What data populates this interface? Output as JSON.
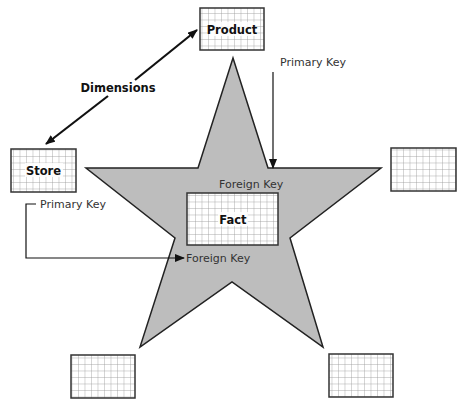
{
  "diagram": {
    "colors": {
      "star_fill": "#bdbdbd",
      "star_stroke": "#222222",
      "table_border": "#333333",
      "grid_line": "#999999",
      "table_fill": "#ffffff",
      "arrow": "#111111"
    },
    "tables": {
      "product": {
        "label": "Product"
      },
      "store": {
        "label": "Store"
      },
      "fact": {
        "label": "Fact"
      },
      "right_dimension": {
        "label": ""
      },
      "bottom_left_dimension": {
        "label": ""
      },
      "bottom_right_dimension": {
        "label": ""
      }
    },
    "annotations": {
      "dimensions": "Dimensions",
      "product_primary_key": "Primary Key",
      "fact_foreign_key_top": "Foreign Key",
      "store_primary_key": "Primary Key",
      "fact_foreign_key_left": "Foreign Key"
    }
  }
}
